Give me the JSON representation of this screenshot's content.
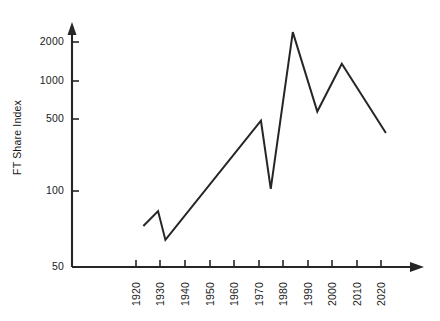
{
  "chart_data": {
    "type": "line",
    "title": "",
    "xlabel": "",
    "ylabel": "FT Share Index",
    "yscale": "log",
    "ylim": [
      50,
      2600
    ],
    "xlim": [
      1917,
      2027
    ],
    "grid": false,
    "legend": null,
    "ytick_labels": [
      "2000",
      "1000",
      "500",
      "100",
      "50"
    ],
    "ytick_values": [
      2000,
      1000,
      500,
      100,
      50
    ],
    "xtick_labels": [
      "1920",
      "1930",
      "1940",
      "1950",
      "1960",
      "1970",
      "1980",
      "1990",
      "2000",
      "2010",
      "2020"
    ],
    "xtick_values": [
      1920,
      1930,
      1940,
      1950,
      1960,
      1970,
      1980,
      1990,
      2000,
      2010,
      2020
    ],
    "series": [
      {
        "name": "FT Share Index",
        "color": "#262626",
        "x": [
          1923,
          1929,
          1932,
          1971,
          1975,
          1984,
          1994,
          2004,
          2022
        ],
        "values": [
          98,
          125,
          78,
          550,
          180,
          2350,
          640,
          1400,
          450
        ]
      }
    ],
    "points": [
      {
        "year": 1923,
        "value": 98
      },
      {
        "year": 1929,
        "value": 125
      },
      {
        "year": 1932,
        "value": 78
      },
      {
        "year": 1971,
        "value": 550
      },
      {
        "year": 1975,
        "value": 180
      },
      {
        "year": 1984,
        "value": 2350
      },
      {
        "year": 1994,
        "value": 640
      },
      {
        "year": 2004,
        "value": 1400
      },
      {
        "year": 2022,
        "value": 450
      }
    ],
    "axis_style": {
      "x_axis_arrow": true,
      "y_axis_arrow": true,
      "axis_color": "#262626"
    }
  }
}
